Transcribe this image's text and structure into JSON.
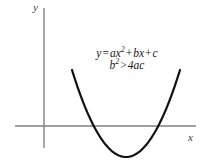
{
  "figure": {
    "background_color": "#ffffff",
    "width": 206,
    "height": 168
  },
  "axes": {
    "color": "#808080",
    "x_axis": {
      "label": "x",
      "y_pixel": 126,
      "x_start": 15,
      "x_end": 196
    },
    "y_axis": {
      "label": "y",
      "x_pixel": 44,
      "y_start": 8,
      "y_end": 148
    }
  },
  "annotation": {
    "line1": {
      "lhs": "y",
      "eq": "=",
      "term1_coef": "ax",
      "term1_exp": "2",
      "plus1": "+",
      "term2": "bx",
      "plus2": "+",
      "term3": "c",
      "full_text": "y = ax2 + bx + c"
    },
    "line2": {
      "lhs": "b",
      "lhs_exp": "2",
      "relation": ">",
      "rhs": "4ac",
      "full_text": "b2 > 4ac"
    }
  },
  "chart_data": {
    "type": "line",
    "title": "",
    "subtitle": "",
    "xlabel": "x",
    "ylabel": "y",
    "grid": false,
    "legend": null,
    "annotations": [
      "y = ax² + bx + c",
      "b² > 4ac"
    ],
    "curve": {
      "name": "parabola",
      "equation": "y = ax^2 + bx + c",
      "condition": "b^2 > 4ac",
      "opens": "upward",
      "color": "#111111",
      "stroke_width": 2.2,
      "roots_count": 2,
      "vertex_pixel": [
        126,
        157
      ],
      "left_root_pixel": [
        98,
        126
      ],
      "right_root_pixel": [
        152,
        126
      ],
      "left_endpoint_pixel": [
        72,
        72
      ],
      "right_endpoint_pixel": [
        180,
        70
      ],
      "path": "M 72,72 C 86,104 96,126 108,146 C 116,158 136,158 146,142 C 158,122 168,98 180,70"
    },
    "axis_origin_pixel": [
      44,
      126
    ],
    "xlim": [
      15,
      196
    ],
    "ylim": [
      148,
      8
    ]
  }
}
